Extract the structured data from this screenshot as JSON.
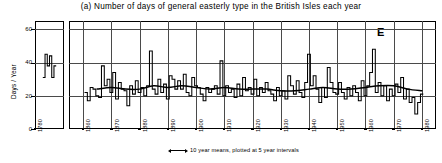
{
  "chart_data": {
    "type": "line",
    "title": "(a) Number of days of general easterly type in the British Isles each year",
    "panel_letter": "E",
    "xlabel": "",
    "ylabel": "Days / Year",
    "ylim": [
      0,
      65
    ],
    "yticks": [
      0,
      20,
      40,
      60
    ],
    "ytick_labels": [
      "0",
      "20",
      "40",
      "60"
    ],
    "xlim": [
      1855,
      1985
    ],
    "xticks": [
      1860,
      1870,
      1880,
      1890,
      1900,
      1910,
      1920,
      1930,
      1940,
      1950,
      1960,
      1970,
      1980
    ],
    "xtick_labels": [
      "1860",
      "1870",
      "1880",
      "1890",
      "1900",
      "1910",
      "1920",
      "1930",
      "1940",
      "1950",
      "1960",
      "1970",
      "1980"
    ],
    "grid": true,
    "inset_panel": {
      "label": "1780",
      "xlim": [
        1775,
        1788
      ],
      "note": "isolated early record segment",
      "x": [
        1779,
        1780,
        1781,
        1782,
        1783,
        1784
      ],
      "values": [
        31,
        45,
        38,
        44,
        31,
        38
      ]
    },
    "annotation": "10 year means, plotted at 5 year intervals",
    "annotation_arrow": "double-headed-arrow",
    "series": [
      {
        "name": "Annual number of easterly days",
        "style": "step",
        "x": [
          1861,
          1862,
          1863,
          1864,
          1865,
          1866,
          1867,
          1868,
          1869,
          1870,
          1871,
          1872,
          1873,
          1874,
          1875,
          1876,
          1877,
          1878,
          1879,
          1880,
          1881,
          1882,
          1883,
          1884,
          1885,
          1886,
          1887,
          1888,
          1889,
          1890,
          1891,
          1892,
          1893,
          1894,
          1895,
          1896,
          1897,
          1898,
          1899,
          1900,
          1901,
          1902,
          1903,
          1904,
          1905,
          1906,
          1907,
          1908,
          1909,
          1910,
          1911,
          1912,
          1913,
          1914,
          1915,
          1916,
          1917,
          1918,
          1919,
          1920,
          1921,
          1922,
          1923,
          1924,
          1925,
          1926,
          1927,
          1928,
          1929,
          1930,
          1931,
          1932,
          1933,
          1934,
          1935,
          1936,
          1937,
          1938,
          1939,
          1940,
          1941,
          1942,
          1943,
          1944,
          1945,
          1946,
          1947,
          1948,
          1949,
          1950,
          1951,
          1952,
          1953,
          1954,
          1955,
          1956,
          1957,
          1958,
          1959,
          1960,
          1961,
          1962,
          1963,
          1964,
          1965,
          1966,
          1967,
          1968,
          1969,
          1970,
          1971,
          1972,
          1973,
          1974,
          1975,
          1976,
          1977,
          1978,
          1979,
          1980
        ],
        "values": [
          22,
          17,
          25,
          24,
          20,
          19,
          38,
          26,
          30,
          22,
          34,
          18,
          28,
          24,
          23,
          14,
          26,
          21,
          29,
          22,
          25,
          20,
          26,
          47,
          24,
          21,
          30,
          22,
          27,
          18,
          32,
          30,
          24,
          29,
          24,
          33,
          22,
          20,
          31,
          26,
          25,
          21,
          17,
          25,
          22,
          24,
          26,
          21,
          41,
          20,
          26,
          22,
          24,
          19,
          27,
          20,
          31,
          23,
          25,
          21,
          30,
          20,
          25,
          22,
          28,
          23,
          21,
          17,
          25,
          20,
          23,
          18,
          32,
          26,
          21,
          29,
          22,
          19,
          28,
          45,
          26,
          32,
          24,
          16,
          25,
          19,
          37,
          28,
          22,
          21,
          28,
          22,
          18,
          25,
          20,
          26,
          22,
          17,
          29,
          20,
          26,
          34,
          48,
          22,
          28,
          20,
          26,
          17,
          24,
          20,
          27,
          22,
          31,
          18,
          24,
          16,
          19,
          9,
          16,
          21
        ]
      },
      {
        "name": "10 year means, plotted at 5 year intervals",
        "style": "smooth",
        "x": [
          1865,
          1870,
          1875,
          1880,
          1885,
          1890,
          1895,
          1900,
          1905,
          1910,
          1915,
          1920,
          1925,
          1930,
          1935,
          1940,
          1945,
          1950,
          1955,
          1960,
          1965,
          1970,
          1975,
          1980
        ],
        "values": [
          24,
          25,
          24,
          24,
          26,
          25,
          26,
          25,
          24,
          25,
          24,
          24,
          24,
          23,
          23,
          24,
          25,
          24,
          24,
          25,
          26,
          26,
          24,
          23
        ]
      }
    ]
  }
}
